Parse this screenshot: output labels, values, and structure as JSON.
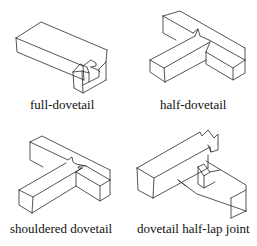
{
  "figure": {
    "panels": [
      {
        "id": "full-dovetail",
        "caption": "full-dovetail"
      },
      {
        "id": "half-dovetail",
        "caption": "half-dovetail"
      },
      {
        "id": "shouldered-dovetail",
        "caption": "shouldered dovetail"
      },
      {
        "id": "dovetail-half-lap-joint",
        "caption": "dovetail half-lap joint"
      }
    ],
    "line_color": "#2a2a2a",
    "background": "#ffffff"
  }
}
